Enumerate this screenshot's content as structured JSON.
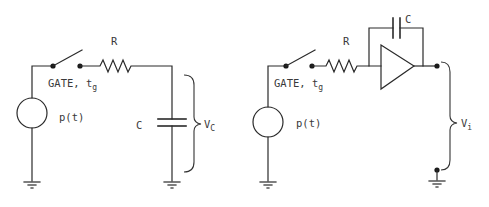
{
  "diagram": {
    "type": "circuit-schematic",
    "panels": [
      {
        "id": "rc-integrator",
        "labels": {
          "resistor": "R",
          "gate": "GATE, t",
          "gate_sub": "g",
          "source": "p(t)",
          "capacitor": "C",
          "output": "V",
          "output_sub": "C"
        },
        "components": [
          "voltage-source p(t)",
          "switch GATE t_g",
          "resistor R",
          "capacitor C",
          "ground",
          "ground"
        ],
        "connections": [
          [
            "ground",
            "p(t)"
          ],
          [
            "p(t)",
            "GATE switch"
          ],
          [
            "GATE switch",
            "R"
          ],
          [
            "R",
            "C"
          ],
          [
            "C",
            "ground"
          ]
        ],
        "measurement": "V_C across capacitor C"
      },
      {
        "id": "opamp-integrator",
        "labels": {
          "resistor": "R",
          "gate": "GATE, t",
          "gate_sub": "g",
          "source": "p(t)",
          "capacitor": "C",
          "output": "V",
          "output_sub": "i"
        },
        "components": [
          "voltage-source p(t)",
          "switch GATE t_g",
          "resistor R",
          "op-amp",
          "feedback capacitor C",
          "ground",
          "ground"
        ],
        "connections": [
          [
            "ground",
            "p(t)"
          ],
          [
            "p(t)",
            "GATE switch"
          ],
          [
            "GATE switch",
            "R"
          ],
          [
            "R",
            "op-amp input"
          ],
          [
            "op-amp input",
            "C"
          ],
          [
            "C",
            "op-amp output"
          ]
        ],
        "measurement": "V_i between op-amp output and ground"
      }
    ]
  }
}
